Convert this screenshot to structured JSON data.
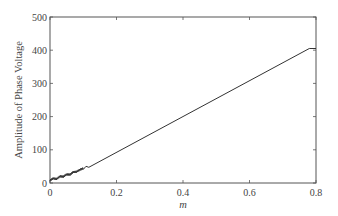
{
  "chart_data": {
    "type": "line",
    "title": "",
    "xlabel": "m",
    "ylabel": "Amplitude of Phase Voltage",
    "xlim": [
      0,
      0.8
    ],
    "ylim": [
      0,
      500
    ],
    "xticks": [
      0,
      0.2,
      0.4,
      0.6,
      0.8
    ],
    "xtick_labels": [
      "0",
      "0.2",
      "0.4",
      "0.6",
      "0.8"
    ],
    "yticks": [
      0,
      100,
      200,
      300,
      400,
      500
    ],
    "ytick_labels": [
      "0",
      "100",
      "200",
      "300",
      "400",
      "500"
    ],
    "grid": false,
    "legend": null,
    "series": [
      {
        "name": "Amplitude of Phase Voltage",
        "x": [
          0,
          0.01,
          0.02,
          0.03,
          0.04,
          0.05,
          0.06,
          0.07,
          0.08,
          0.09,
          0.1,
          0.15,
          0.2,
          0.3,
          0.4,
          0.5,
          0.6,
          0.7,
          0.78,
          0.8
        ],
        "values": [
          8,
          14,
          12,
          20,
          19,
          26,
          25,
          33,
          34,
          40,
          44,
          63,
          82,
          125,
          168,
          210,
          250,
          292,
          405,
          405
        ]
      }
    ],
    "color": "#333333"
  },
  "ui": {
    "line_color": "#333333",
    "frame_color": "#555555"
  }
}
